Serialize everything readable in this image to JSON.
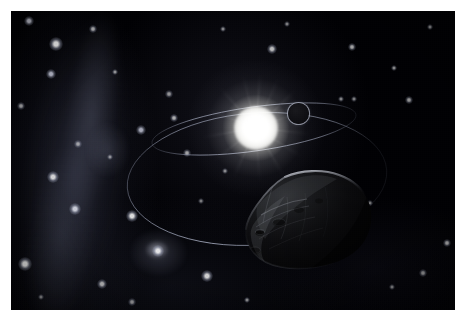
{
  "artwork": {
    "title": "Artist's concept of an asteroid orbiting a distant star",
    "medium": "digital space illustration",
    "frame": {
      "border_color": "#ffffff",
      "border_top_px": 11,
      "border_left_px": 11,
      "border_right_px": 10,
      "border_bottom_px": 10
    },
    "canvas": {
      "width_px": 444,
      "height_px": 299,
      "background_color": "#000004"
    }
  },
  "scene": {
    "background_label": "deep-space starfield",
    "milky_way": {
      "label": "Milky Way band",
      "position": "left edge, vertical, tilted",
      "color": "#828aa0"
    },
    "star_cluster": {
      "label": "globular star cluster",
      "position": "lower left",
      "color": "#d7daeb"
    },
    "secondary_haze": {
      "label": "nebular haze",
      "position": "upper left",
      "color": "#8c92ac"
    },
    "sun": {
      "label": "central star",
      "center_x": 245,
      "center_y": 117,
      "core_radius_px": 22,
      "halo_radius_px": 70,
      "core_color": "#ffffff",
      "halo_color": "#e2e2de"
    },
    "planet": {
      "label": "orbiting planet",
      "center_x": 287,
      "center_y": 102,
      "radius_px": 11,
      "rim_color": "#b0b4c4",
      "body_color": "#141418"
    },
    "asteroid": {
      "label": "asteroid",
      "center_x": 294,
      "center_y": 213,
      "width_px": 150,
      "height_px": 120,
      "body_color": "#0a0a0c",
      "rim_light_color": "#8d8f96",
      "lit_side": "upper-left"
    },
    "orbits": [
      {
        "label": "inner orbit",
        "center_x": 243,
        "center_y": 118,
        "radius_x": 103,
        "radius_y": 22,
        "rotation_deg": -8,
        "stroke_color": "#9aa0b4",
        "stroke_width": 0.8
      },
      {
        "label": "outer orbit",
        "center_x": 246,
        "center_y": 168,
        "radius_x": 130,
        "radius_y": 66,
        "rotation_deg": -4,
        "stroke_color": "#8e94a8",
        "stroke_width": 0.9
      }
    ],
    "notable_stars": [
      {
        "x": 45,
        "y": 33,
        "r": 5.5,
        "brightness": 0.95,
        "tint": "#ffffff"
      },
      {
        "x": 18,
        "y": 10,
        "r": 4.0,
        "brightness": 0.8,
        "tint": "#eef0ff"
      },
      {
        "x": 82,
        "y": 18,
        "r": 3.0,
        "brightness": 0.7,
        "tint": "#ffffff"
      },
      {
        "x": 40,
        "y": 63,
        "r": 4.2,
        "brightness": 0.78,
        "tint": "#e8ecff"
      },
      {
        "x": 10,
        "y": 95,
        "r": 3.2,
        "brightness": 0.62,
        "tint": "#ffffff"
      },
      {
        "x": 42,
        "y": 166,
        "r": 4.6,
        "brightness": 0.82,
        "tint": "#ffffff"
      },
      {
        "x": 14,
        "y": 253,
        "r": 5.2,
        "brightness": 0.88,
        "tint": "#ffffff"
      },
      {
        "x": 64,
        "y": 198,
        "r": 4.4,
        "brightness": 0.8,
        "tint": "#f2f4ff"
      },
      {
        "x": 121,
        "y": 205,
        "r": 4.8,
        "brightness": 0.85,
        "tint": "#ffffff"
      },
      {
        "x": 147,
        "y": 240,
        "r": 4.4,
        "brightness": 0.8,
        "tint": "#ffffff"
      },
      {
        "x": 91,
        "y": 273,
        "r": 4.0,
        "brightness": 0.72,
        "tint": "#ffffff"
      },
      {
        "x": 196,
        "y": 265,
        "r": 4.6,
        "brightness": 0.8,
        "tint": "#ffffff"
      },
      {
        "x": 163,
        "y": 107,
        "r": 3.4,
        "brightness": 0.66,
        "tint": "#ffffff"
      },
      {
        "x": 130,
        "y": 119,
        "r": 3.8,
        "brightness": 0.7,
        "tint": "#e9ecff"
      },
      {
        "x": 176,
        "y": 142,
        "r": 3.2,
        "brightness": 0.62,
        "tint": "#ffffff"
      },
      {
        "x": 158,
        "y": 83,
        "r": 2.8,
        "brightness": 0.56,
        "tint": "#ffffff"
      },
      {
        "x": 261,
        "y": 38,
        "r": 3.6,
        "brightness": 0.72,
        "tint": "#ffffff"
      },
      {
        "x": 214,
        "y": 160,
        "r": 2.6,
        "brightness": 0.54,
        "tint": "#ffffff"
      },
      {
        "x": 341,
        "y": 36,
        "r": 3.2,
        "brightness": 0.66,
        "tint": "#ffffff"
      },
      {
        "x": 383,
        "y": 57,
        "r": 2.6,
        "brightness": 0.56,
        "tint": "#ffffff"
      },
      {
        "x": 330,
        "y": 88,
        "r": 2.4,
        "brightness": 0.5,
        "tint": "#ffffff"
      },
      {
        "x": 398,
        "y": 89,
        "r": 3.0,
        "brightness": 0.6,
        "tint": "#ffffff"
      },
      {
        "x": 343,
        "y": 88,
        "r": 2.2,
        "brightness": 0.48,
        "tint": "#ffffff"
      },
      {
        "x": 419,
        "y": 16,
        "r": 2.6,
        "brightness": 0.54,
        "tint": "#ffffff"
      },
      {
        "x": 276,
        "y": 13,
        "r": 2.4,
        "brightness": 0.5,
        "tint": "#ffffff"
      },
      {
        "x": 212,
        "y": 18,
        "r": 2.4,
        "brightness": 0.5,
        "tint": "#ffffff"
      },
      {
        "x": 436,
        "y": 232,
        "r": 3.4,
        "brightness": 0.68,
        "tint": "#ffffff"
      },
      {
        "x": 412,
        "y": 262,
        "r": 2.8,
        "brightness": 0.58,
        "tint": "#ffffff"
      },
      {
        "x": 381,
        "y": 276,
        "r": 2.4,
        "brightness": 0.5,
        "tint": "#ffffff"
      },
      {
        "x": 236,
        "y": 289,
        "r": 2.6,
        "brightness": 0.54,
        "tint": "#ffffff"
      },
      {
        "x": 121,
        "y": 291,
        "r": 3.0,
        "brightness": 0.58,
        "tint": "#ffffff"
      },
      {
        "x": 30,
        "y": 286,
        "r": 2.6,
        "brightness": 0.52,
        "tint": "#ffffff"
      },
      {
        "x": 67,
        "y": 133,
        "r": 2.8,
        "brightness": 0.56,
        "tint": "#ffffff"
      },
      {
        "x": 99,
        "y": 146,
        "r": 2.4,
        "brightness": 0.5,
        "tint": "#ffffff"
      },
      {
        "x": 104,
        "y": 61,
        "r": 2.6,
        "brightness": 0.54,
        "tint": "#ffffff"
      },
      {
        "x": 190,
        "y": 190,
        "r": 2.2,
        "brightness": 0.46,
        "tint": "#ffffff"
      },
      {
        "x": 359,
        "y": 192,
        "r": 2.2,
        "brightness": 0.44,
        "tint": "#ffffff"
      }
    ]
  }
}
